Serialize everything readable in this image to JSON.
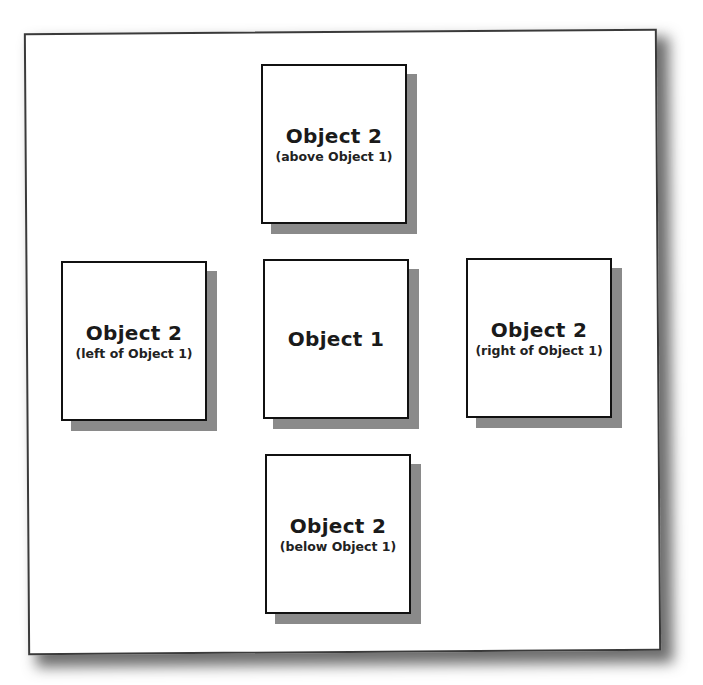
{
  "diagram": {
    "center": {
      "title": "Object 1"
    },
    "above": {
      "title": "Object 2",
      "subtitle": "(above Object 1)"
    },
    "left": {
      "title": "Object 2",
      "subtitle": "(left of Object 1)"
    },
    "right": {
      "title": "Object 2",
      "subtitle": "(right of Object 1)"
    },
    "below": {
      "title": "Object 2",
      "subtitle": "(below Object 1)"
    }
  },
  "colors": {
    "box_border": "#111111",
    "box_shadow": "#8a8a8a",
    "background": "#ffffff"
  }
}
